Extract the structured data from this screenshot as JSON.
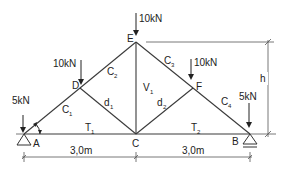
{
  "nodes": {
    "A": "A",
    "B": "B",
    "C": "C",
    "D": "D",
    "E": "E",
    "F": "F"
  },
  "members": {
    "C1": {
      "base": "C",
      "sub": "1"
    },
    "C2": {
      "base": "C",
      "sub": "2"
    },
    "C3": {
      "base": "C",
      "sub": "3"
    },
    "C4": {
      "base": "C",
      "sub": "4"
    },
    "d1": {
      "base": "d",
      "sub": "1"
    },
    "d2": {
      "base": "d",
      "sub": "2"
    },
    "V1": {
      "base": "V",
      "sub": "1"
    },
    "T1": {
      "base": "T",
      "sub": "1"
    },
    "T2": {
      "base": "T",
      "sub": "2"
    }
  },
  "loads": {
    "A": "5kN",
    "D": "10kN",
    "E": "10kN",
    "F": "10kN",
    "B": "5kN"
  },
  "dimensions": {
    "left_span": "3,0m",
    "right_span": "3,0m",
    "height": "h"
  }
}
